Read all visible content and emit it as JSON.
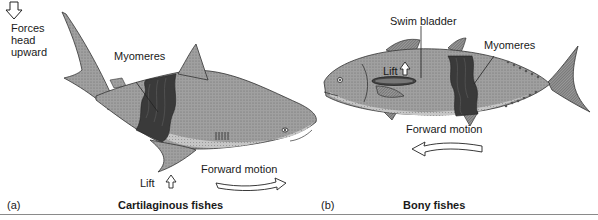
{
  "panels": [
    {
      "letter": "(a)",
      "caption": "Cartilaginous fishes",
      "labels": {
        "forces": [
          "Forces",
          "head",
          "upward"
        ],
        "myomeres": "Myomeres",
        "lift": "Lift",
        "forward_motion": "Forward motion"
      }
    },
    {
      "letter": "(b)",
      "caption": "Bony fishes",
      "labels": {
        "swim_bladder": "Swim bladder",
        "myomeres": "Myomeres",
        "lift": "Lift",
        "forward_motion": "Forward motion"
      }
    }
  ],
  "colors": {
    "body_fill": "#9a9a9a",
    "belly_fill": "#c8c8c8",
    "myomere_fill": "#3a3a3a",
    "outline": "#222222",
    "rule": "#8a8a8a"
  }
}
